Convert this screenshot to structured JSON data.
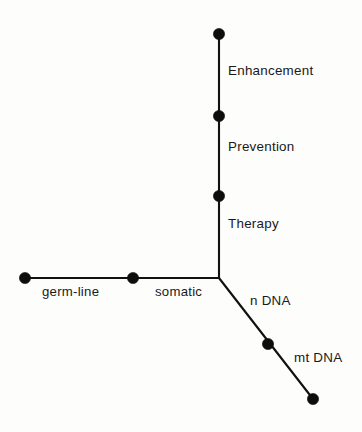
{
  "figure": {
    "background_color": "#fdfdfb",
    "line_color": "#111111",
    "node_color": "#0d0d0d",
    "text_color": "#1a1a1a",
    "width": 362,
    "height": 432
  },
  "axes": {
    "vertical": {
      "name": "intervention-purpose-axis",
      "origin": {
        "x": 219,
        "y": 278
      },
      "end": {
        "x": 219,
        "y": 34
      },
      "labels": [
        {
          "text": "Enhancement",
          "x": 228,
          "y": 64
        },
        {
          "text": "Prevention",
          "x": 228,
          "y": 140
        },
        {
          "text": "Therapy",
          "x": 228,
          "y": 217
        }
      ],
      "nodes": [
        {
          "name": "node-enhancement",
          "x": 219,
          "y": 34
        },
        {
          "name": "node-prevention",
          "x": 219,
          "y": 116
        },
        {
          "name": "node-therapy",
          "x": 219,
          "y": 196
        }
      ]
    },
    "horizontal": {
      "name": "cell-target-axis",
      "origin": {
        "x": 219,
        "y": 278
      },
      "end": {
        "x": 25,
        "y": 278
      },
      "labels": [
        {
          "text": "germ-line",
          "x": 42,
          "y": 285
        },
        {
          "text": "somatic",
          "x": 155,
          "y": 285
        }
      ],
      "nodes": [
        {
          "name": "node-germ-line",
          "x": 25,
          "y": 278
        },
        {
          "name": "node-somatic",
          "x": 133,
          "y": 278
        }
      ]
    },
    "diagonal": {
      "name": "dna-type-axis",
      "origin": {
        "x": 219,
        "y": 278
      },
      "end": {
        "x": 313,
        "y": 399
      },
      "labels": [
        {
          "text": "n DNA",
          "x": 250,
          "y": 294
        },
        {
          "text": "mt DNA",
          "x": 294,
          "y": 351
        }
      ],
      "nodes": [
        {
          "name": "node-n-dna",
          "x": 268,
          "y": 344
        },
        {
          "name": "node-mt-dna",
          "x": 313,
          "y": 399
        }
      ]
    }
  },
  "node_radius": 5.6
}
